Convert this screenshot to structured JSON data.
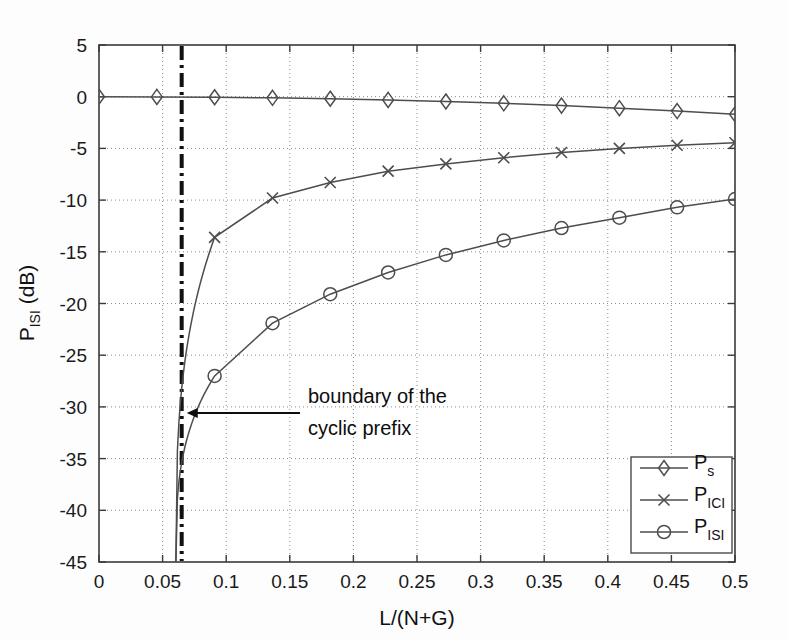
{
  "chart_data": {
    "type": "line",
    "title": "",
    "xlabel": "L/(N+G)",
    "ylabel": "P_ISI (dB)",
    "ylabel_base": "P",
    "ylabel_sub": "ISI",
    "ylabel_unit": " (dB)",
    "xlim": [
      0,
      0.5
    ],
    "ylim": [
      -45,
      5
    ],
    "xticks": [
      0,
      0.05,
      0.1,
      0.15,
      0.2,
      0.25,
      0.3,
      0.35,
      0.4,
      0.45,
      0.5
    ],
    "xticklabels": [
      "0",
      "0.05",
      "0.1",
      "0.15",
      "0.2",
      "0.25",
      "0.3",
      "0.35",
      "0.4",
      "0.45",
      "0.5"
    ],
    "yticks": [
      5,
      0,
      -5,
      -10,
      -15,
      -20,
      -25,
      -30,
      -35,
      -40,
      -45
    ],
    "yticklabels": [
      "5",
      "0",
      "-5",
      "-10",
      "-15",
      "-20",
      "-25",
      "-30",
      "-35",
      "-40",
      "-45"
    ],
    "grid": true,
    "grid_style": "dotted",
    "legend_position": "lower right",
    "series": [
      {
        "name": "P_s",
        "label_base": "P",
        "label_sub": "s",
        "marker": "diamond",
        "color": "#4d4d4d",
        "x": [
          0,
          0.0455,
          0.0909,
          0.1364,
          0.1818,
          0.2273,
          0.2727,
          0.3182,
          0.3636,
          0.4091,
          0.4545,
          0.5
        ],
        "y": [
          0.0,
          -0.02,
          -0.05,
          -0.11,
          -0.2,
          -0.31,
          -0.46,
          -0.64,
          -0.86,
          -1.11,
          -1.39,
          -1.7
        ]
      },
      {
        "name": "P_ICI",
        "label_base": "P",
        "label_sub": "ICI",
        "marker": "x",
        "color": "#4d4d4d",
        "x": [
          0.0909,
          0.1364,
          0.1818,
          0.2273,
          0.2727,
          0.3182,
          0.3636,
          0.4091,
          0.4545,
          0.5
        ],
        "y": [
          -13.6,
          -9.8,
          -8.3,
          -7.2,
          -6.5,
          -5.9,
          -5.4,
          -5.0,
          -4.7,
          -4.45
        ]
      },
      {
        "name": "P_ISI",
        "label_base": "P",
        "label_sub": "ISI",
        "marker": "circle",
        "color": "#4d4d4d",
        "x": [
          0.0909,
          0.1364,
          0.1818,
          0.2273,
          0.2727,
          0.3182,
          0.3636,
          0.4091,
          0.4545,
          0.5
        ],
        "y": [
          -27.0,
          -21.9,
          -19.1,
          -17.0,
          -15.3,
          -13.9,
          -12.7,
          -11.7,
          -10.7,
          -9.9
        ]
      }
    ],
    "vertical_marker": {
      "x": 0.065,
      "style": "dash-dot",
      "color": "#111111",
      "width": 4
    },
    "annotations": [
      {
        "text_line1": "boundary of the",
        "text_line2": "cyclic prefix",
        "text": "boundary of the cyclic prefix",
        "arrow_from_x": 0.158,
        "arrow_from_y": -30.6,
        "arrow_to_x": 0.069,
        "arrow_to_y": -30.6
      }
    ]
  }
}
